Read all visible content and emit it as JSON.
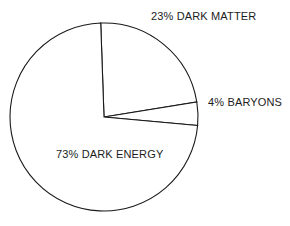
{
  "chart_data": {
    "type": "pie",
    "title": "",
    "subtitle": "",
    "xlabel": "",
    "ylabel": "",
    "categories": [
      "DARK MATTER",
      "BARYONS",
      "DARK ENERGY"
    ],
    "values": [
      23,
      4,
      73
    ],
    "unit": "%",
    "slices": [
      {
        "name": "DARK MATTER",
        "value": 23,
        "label": "23% DARK MATTER",
        "start_angle_deg": -92,
        "end_angle_deg": -9.2,
        "sweep_deg": 82.8,
        "fill": "#ffffff",
        "stroke": "#1a1a1a"
      },
      {
        "name": "BARYONS",
        "value": 4,
        "label": "4% BARYONS",
        "start_angle_deg": -9.2,
        "end_angle_deg": 5.2,
        "sweep_deg": 14.4,
        "fill": "#ffffff",
        "stroke": "#1a1a1a"
      },
      {
        "name": "DARK ENERGY",
        "value": 73,
        "label": "73% DARK ENERGY",
        "start_angle_deg": 5.2,
        "end_angle_deg": 268,
        "sweep_deg": 262.8,
        "fill": "#ffffff",
        "stroke": "#1a1a1a"
      }
    ],
    "legend": "none",
    "legend_position": "outside-labels",
    "grid": false,
    "background_color": "#ffffff",
    "line_color": "#1a1a1a",
    "geometry": {
      "center_x": 104,
      "center_y": 117,
      "radius": 94
    }
  },
  "labels": {
    "dark_matter": "23% DARK MATTER",
    "baryons": "4% BARYONS",
    "dark_energy": "73% DARK ENERGY"
  }
}
